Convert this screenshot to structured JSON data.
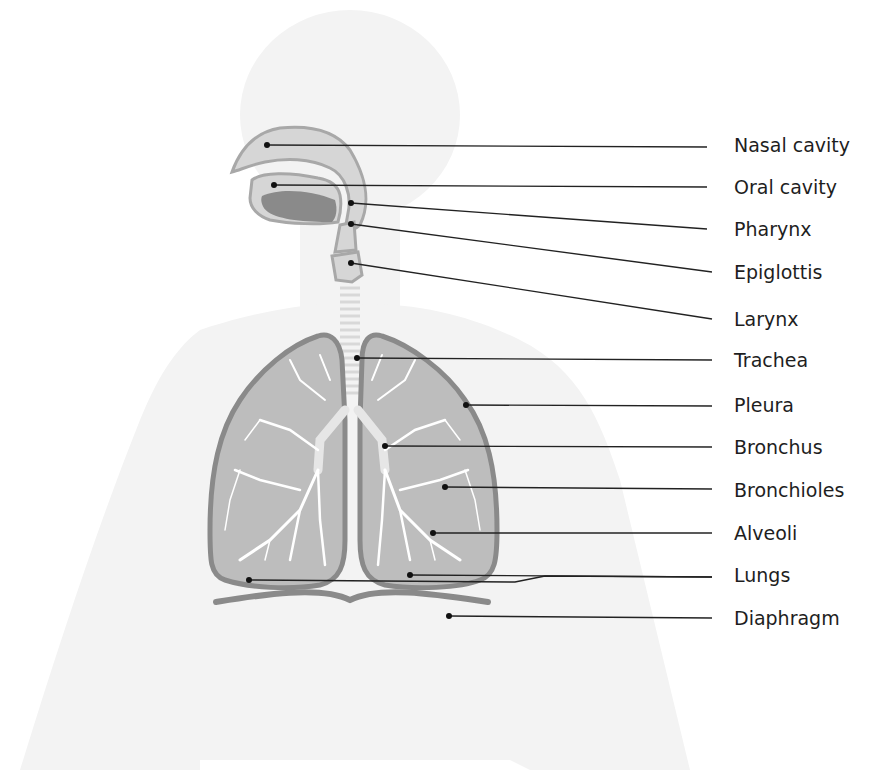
{
  "diagram": {
    "colors": {
      "background": "#ffffff",
      "silhouette": "#f2f2f2",
      "organ_fill": "#c9c9c9",
      "organ_light": "#d9d9d9",
      "organ_outline": "#8c8c8c",
      "tongue": "#8a8a8a",
      "airways": "#ffffff",
      "leader_line": "#222222"
    },
    "labels": [
      {
        "id": "nasal-cavity",
        "text": "Nasal cavity",
        "label_y": 145,
        "point": [
          267,
          145
        ]
      },
      {
        "id": "oral-cavity",
        "text": "Oral cavity",
        "label_y": 187,
        "point": [
          274,
          185
        ]
      },
      {
        "id": "pharynx",
        "text": "Pharynx",
        "label_y": 229,
        "point": [
          351,
          203
        ]
      },
      {
        "id": "epiglottis",
        "text": "Epiglottis",
        "label_y": 272,
        "point": [
          351,
          224
        ]
      },
      {
        "id": "larynx",
        "text": "Larynx",
        "label_y": 319,
        "point": [
          351,
          263
        ]
      },
      {
        "id": "trachea",
        "text": "Trachea",
        "label_y": 360,
        "point": [
          357,
          358
        ]
      },
      {
        "id": "pleura",
        "text": "Pleura",
        "label_y": 405,
        "point": [
          466,
          405
        ]
      },
      {
        "id": "bronchus",
        "text": "Bronchus",
        "label_y": 447,
        "point": [
          385,
          446
        ]
      },
      {
        "id": "bronchioles",
        "text": "Bronchioles",
        "label_y": 490,
        "point": [
          445,
          487
        ]
      },
      {
        "id": "alveoli",
        "text": "Alveoli",
        "label_y": 533,
        "point": [
          433,
          533
        ]
      },
      {
        "id": "lungs",
        "text": "Lungs",
        "label_y": 575,
        "point": [
          249,
          580
        ],
        "point2": [
          410,
          575
        ]
      },
      {
        "id": "diaphragm",
        "text": "Diaphragm",
        "label_y": 618,
        "point": [
          449,
          616
        ]
      }
    ]
  }
}
